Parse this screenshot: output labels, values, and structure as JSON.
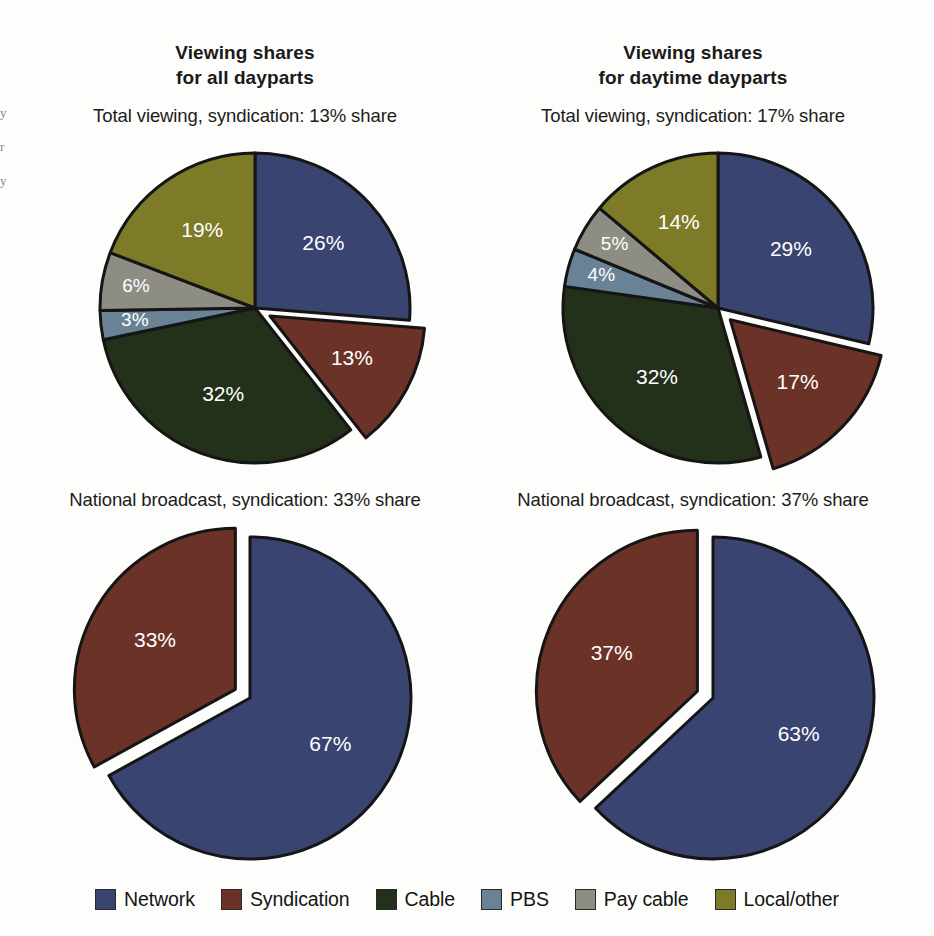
{
  "columns": [
    {
      "title_line1": "Viewing shares",
      "title_line2": "for all dayparts"
    },
    {
      "title_line1": "Viewing shares",
      "title_line2": "for daytime dayparts"
    }
  ],
  "legend": {
    "items": [
      {
        "label": "Network",
        "color": "#394470"
      },
      {
        "label": "Syndication",
        "color": "#6b3328"
      },
      {
        "label": "Cable",
        "color": "#23301a"
      },
      {
        "label": "PBS",
        "color": "#6a8296"
      },
      {
        "label": "Pay cable",
        "color": "#8d8d84"
      },
      {
        "label": "Local/other",
        "color": "#7d7a28"
      }
    ]
  },
  "chart_data": [
    {
      "type": "pie",
      "id": "all-dayparts-total",
      "title": "Total viewing, syndication: 13% share",
      "position": "top-left",
      "start_angle": 0,
      "categories": [
        "Network",
        "Syndication",
        "Cable",
        "PBS",
        "Pay cable",
        "Local/other"
      ],
      "values": [
        26,
        13,
        32,
        3,
        6,
        19
      ],
      "labels": [
        "26%",
        "13%",
        "32%",
        "3%",
        "6%",
        "19%"
      ],
      "colors": [
        "#394470",
        "#6b3328",
        "#23301a",
        "#6a8296",
        "#8d8d84",
        "#7d7a28"
      ],
      "exploded": [
        "Syndication"
      ]
    },
    {
      "type": "pie",
      "id": "daytime-dayparts-total",
      "title": "Total viewing, syndication: 17% share",
      "position": "top-right",
      "start_angle": 0,
      "categories": [
        "Network",
        "Syndication",
        "Cable",
        "PBS",
        "Pay cable",
        "Local/other"
      ],
      "values": [
        29,
        17,
        32,
        4,
        5,
        14
      ],
      "labels": [
        "29%",
        "17%",
        "32%",
        "4%",
        "5%",
        "14%"
      ],
      "colors": [
        "#394470",
        "#6b3328",
        "#23301a",
        "#6a8296",
        "#8d8d84",
        "#7d7a28"
      ],
      "exploded": [
        "Syndication"
      ]
    },
    {
      "type": "pie",
      "id": "all-dayparts-national",
      "title": "National broadcast, syndication: 33% share",
      "position": "bottom-left",
      "start_angle": 0,
      "categories": [
        "Network",
        "Syndication"
      ],
      "values": [
        67,
        33
      ],
      "labels": [
        "67%",
        "33%"
      ],
      "colors": [
        "#394470",
        "#6b3328"
      ],
      "exploded": [
        "Syndication"
      ]
    },
    {
      "type": "pie",
      "id": "daytime-dayparts-national",
      "title": "National broadcast, syndication: 37% share",
      "position": "bottom-right",
      "start_angle": 0,
      "categories": [
        "Network",
        "Syndication"
      ],
      "values": [
        63,
        37
      ],
      "labels": [
        "63%",
        "37%"
      ],
      "colors": [
        "#394470",
        "#6b3328"
      ],
      "exploded": [
        "Syndication"
      ]
    }
  ]
}
